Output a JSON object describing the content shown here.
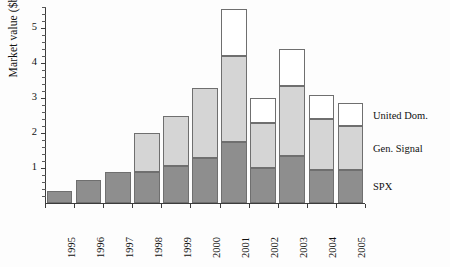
{
  "chart_data": {
    "type": "bar",
    "subtype": "stacked-bar",
    "title": "",
    "subtitle": "",
    "xlabel": "",
    "ylabel": "Market value ($b)",
    "categories": [
      "1995",
      "1996",
      "1997",
      "1998",
      "1999",
      "2000",
      "2001",
      "2002",
      "2003",
      "2004",
      "2005"
    ],
    "series": [
      {
        "name": "SPX",
        "color": "#8e8e8e",
        "values": [
          0.35,
          0.65,
          0.9,
          0.9,
          1.05,
          1.3,
          1.75,
          1.0,
          1.35,
          0.95,
          0.95
        ]
      },
      {
        "name": "Gen. Signal",
        "color": "#d5d5d5",
        "values": [
          0.0,
          0.0,
          0.0,
          1.1,
          1.45,
          2.0,
          2.45,
          1.3,
          2.0,
          1.45,
          1.25
        ]
      },
      {
        "name": "United Dom.",
        "color": "#ffffff",
        "values": [
          0.0,
          0.0,
          0.0,
          0.0,
          0.0,
          0.0,
          1.35,
          0.7,
          1.05,
          0.7,
          0.65
        ]
      }
    ],
    "totals": [
      0.35,
      0.65,
      0.9,
      2.0,
      2.5,
      3.3,
      5.55,
      3.0,
      4.4,
      3.1,
      2.85
    ],
    "ylim": [
      0,
      5.6
    ],
    "ytick_labels": [
      "1",
      "2",
      "3",
      "4",
      "5"
    ],
    "ytick_values": [
      1,
      2,
      3,
      4,
      5
    ],
    "yminor_step": 0.2,
    "grid": false,
    "legend_position": "right-outside",
    "legend": [
      {
        "label": "United Dom.",
        "color": "#ffffff"
      },
      {
        "label": "Gen. Signal",
        "color": "#d5d5d5"
      },
      {
        "label": "SPX",
        "color": "#8e8e8e"
      }
    ]
  }
}
